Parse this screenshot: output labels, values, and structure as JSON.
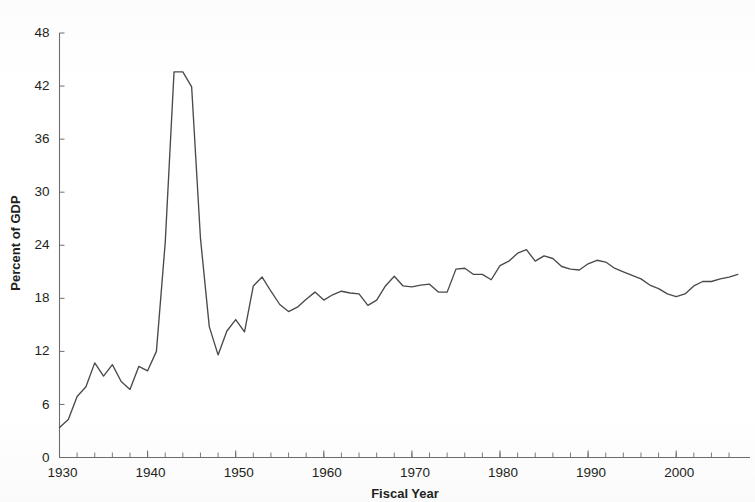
{
  "chart_data": {
    "type": "line",
    "title": "",
    "xlabel": "Fiscal Year",
    "ylabel": "Percent of GDP",
    "xlim": [
      1930,
      2007
    ],
    "ylim": [
      0,
      48
    ],
    "ytick_labels": [
      "0",
      "6",
      "12",
      "18",
      "24",
      "30",
      "36",
      "42",
      "48"
    ],
    "yticks": [
      0,
      6,
      12,
      18,
      24,
      30,
      36,
      42,
      48
    ],
    "xtick_labels": [
      "1930",
      "1940",
      "1950",
      "1960",
      "1970",
      "1980",
      "1990",
      "2000"
    ],
    "xticks": [
      1930,
      1940,
      1950,
      1960,
      1970,
      1980,
      1990,
      2000
    ],
    "x_minor_tick_step": 2,
    "grid": false,
    "legend": "none",
    "line_color": "#4a4a4a",
    "series": [
      {
        "name": "Total outlays",
        "x": [
          1930,
          1931,
          1932,
          1933,
          1934,
          1935,
          1936,
          1937,
          1938,
          1939,
          1940,
          1941,
          1942,
          1943,
          1944,
          1945,
          1946,
          1947,
          1948,
          1949,
          1950,
          1951,
          1952,
          1953,
          1954,
          1955,
          1956,
          1957,
          1958,
          1959,
          1960,
          1961,
          1962,
          1963,
          1964,
          1965,
          1966,
          1967,
          1968,
          1969,
          1970,
          1971,
          1972,
          1973,
          1974,
          1975,
          1976,
          1977,
          1978,
          1979,
          1980,
          1981,
          1982,
          1983,
          1984,
          1985,
          1986,
          1987,
          1988,
          1989,
          1990,
          1991,
          1992,
          1993,
          1994,
          1995,
          1996,
          1997,
          1998,
          1999,
          2000,
          2001,
          2002,
          2003,
          2004,
          2005,
          2006,
          2007
        ],
        "values": [
          3.4,
          4.3,
          6.9,
          8.0,
          10.7,
          9.2,
          10.5,
          8.6,
          7.7,
          10.3,
          9.8,
          12.0,
          24.3,
          43.6,
          43.6,
          41.9,
          24.8,
          14.8,
          11.6,
          14.3,
          15.6,
          14.2,
          19.4,
          20.4,
          18.8,
          17.3,
          16.5,
          17.0,
          17.9,
          18.7,
          17.8,
          18.4,
          18.8,
          18.6,
          18.5,
          17.2,
          17.8,
          19.4,
          20.5,
          19.4,
          19.3,
          19.5,
          19.6,
          18.7,
          18.7,
          21.3,
          21.4,
          20.7,
          20.7,
          20.1,
          21.7,
          22.2,
          23.1,
          23.5,
          22.2,
          22.8,
          22.5,
          21.6,
          21.3,
          21.2,
          21.9,
          22.3,
          22.1,
          21.4,
          21.0,
          20.6,
          20.2,
          19.5,
          19.1,
          18.5,
          18.2,
          18.5,
          19.4,
          19.9,
          19.9,
          20.2,
          20.4,
          20.7
        ]
      }
    ]
  },
  "axis": {
    "y_title": "Percent of GDP",
    "x_title": "Fiscal Year"
  }
}
